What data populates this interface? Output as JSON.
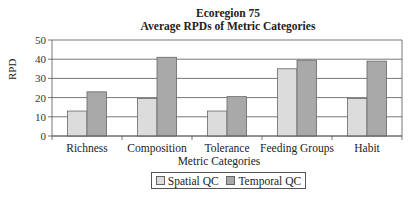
{
  "chart_data": {
    "type": "bar",
    "title": "Ecoregion 75",
    "subtitle": "Average RPDs of Metric Categories",
    "xlabel": "Metric Categories",
    "ylabel": "RPD",
    "ylim": [
      0,
      50
    ],
    "yticks": [
      0,
      10,
      20,
      30,
      40,
      50
    ],
    "grid": true,
    "legend_position": "bottom",
    "categories": [
      "Richness",
      "Composition",
      "Tolerance",
      "Feeding Groups",
      "Habit"
    ],
    "series": [
      {
        "name": "Spatial QC",
        "color": "#dcdcdc",
        "values": [
          13,
          19.5,
          13,
          35,
          19.5
        ]
      },
      {
        "name": "Temporal QC",
        "color": "#a9a9a9",
        "values": [
          23,
          41,
          20.5,
          39.5,
          39
        ]
      }
    ]
  }
}
